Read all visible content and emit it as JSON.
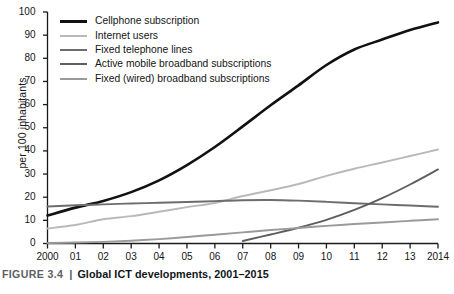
{
  "caption": {
    "figure_label": "FIGURE 3.4",
    "separator": "|",
    "title": "Global ICT developments, 2001–2015"
  },
  "axes": {
    "ylabel": "per 100 inhabitants",
    "yticks": [
      "0",
      "10",
      "20",
      "30",
      "40",
      "50",
      "60",
      "70",
      "80",
      "90",
      "100"
    ],
    "xticks": [
      "2000",
      "01",
      "02",
      "03",
      "04",
      "05",
      "06",
      "07",
      "08",
      "09",
      "10",
      "11",
      "12",
      "13",
      "2014"
    ]
  },
  "chart_data": {
    "type": "line",
    "title": "Global ICT developments, 2001–2015",
    "xlabel": "",
    "ylabel": "per 100 inhabitants",
    "xlim": [
      2000,
      2014
    ],
    "ylim": [
      0,
      100
    ],
    "grid": false,
    "legend_position": "top-left",
    "x": [
      2000,
      2001,
      2002,
      2003,
      2004,
      2005,
      2006,
      2007,
      2008,
      2009,
      2010,
      2011,
      2012,
      2013,
      2014
    ],
    "series": [
      {
        "name": "Cellphone subscription",
        "color": "#111111",
        "width": 2.6,
        "values": [
          12.1,
          15.5,
          18.4,
          22.2,
          27.3,
          33.9,
          41.7,
          50.6,
          59.7,
          68.3,
          77.1,
          83.8,
          88.1,
          92.2,
          95.5
        ]
      },
      {
        "name": "Internet users",
        "color": "#b9b9b9",
        "width": 1.9,
        "values": [
          6.5,
          8.0,
          10.5,
          11.8,
          13.7,
          15.7,
          17.5,
          20.5,
          23.0,
          25.7,
          29.2,
          32.3,
          35.0,
          37.8,
          40.6
        ]
      },
      {
        "name": "Fixed telephone lines",
        "color": "#6d6d6d",
        "width": 1.9,
        "values": [
          16.0,
          16.5,
          16.9,
          17.3,
          17.6,
          17.9,
          18.3,
          18.7,
          18.8,
          18.5,
          18.0,
          17.4,
          16.9,
          16.4,
          15.9
        ]
      },
      {
        "name": "Active mobile broadband subscriptions",
        "color": "#5e5e5e",
        "width": 1.9,
        "values": [
          null,
          null,
          null,
          null,
          null,
          null,
          null,
          1.1,
          3.9,
          6.8,
          10.2,
          14.5,
          19.6,
          25.5,
          32.0
        ]
      },
      {
        "name": "Fixed (wired) broadband subscriptions",
        "color": "#9a9a9a",
        "width": 1.9,
        "values": [
          0.2,
          0.4,
          0.7,
          1.2,
          1.9,
          2.8,
          3.8,
          4.8,
          5.8,
          6.7,
          7.6,
          8.4,
          9.1,
          9.8,
          10.5
        ]
      }
    ]
  }
}
